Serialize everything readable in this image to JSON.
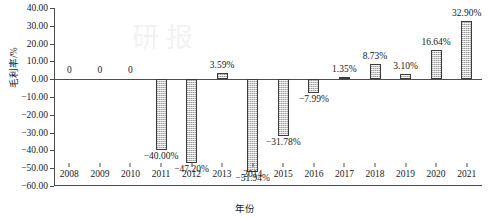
{
  "chart_data": {
    "type": "bar",
    "title": "",
    "xlabel": "年份",
    "ylabel": "毛利率/%",
    "categories": [
      "2008",
      "2009",
      "2010",
      "2011",
      "2012",
      "2013",
      "2014",
      "2015",
      "2016",
      "2017",
      "2018",
      "2019",
      "2020",
      "2021"
    ],
    "values": [
      0,
      0,
      0,
      -40.0,
      -47.2,
      3.59,
      -51.94,
      -31.78,
      -7.99,
      1.35,
      8.73,
      3.1,
      16.64,
      32.9
    ],
    "data_labels": [
      "0",
      "0",
      "0",
      "−40.00%",
      "−47.20%",
      "3.59%",
      "−51.94%",
      "−31.78%",
      "−7.99%",
      "1.35%",
      "8.73%",
      "3.10%",
      "16.64%",
      "32.90%"
    ],
    "ylim": [
      -60,
      40
    ],
    "yticks": [
      40,
      30,
      20,
      10,
      0,
      -10,
      -20,
      -30,
      -40,
      -50,
      -60
    ],
    "ytick_labels": [
      "40.00",
      "30.00",
      "20.00",
      "10.00",
      "0.00",
      "−10.00",
      "−20.00",
      "−30.00",
      "−40.00",
      "−50.00",
      "−60.00"
    ],
    "grid": false,
    "legend": null,
    "series_name": "毛利率",
    "bar_fill_color": "#c9c9c9",
    "bar_edge_color": "#3c3c3c",
    "axis_color": "#4d4d4d"
  },
  "watermark": {
    "text": "研报"
  }
}
